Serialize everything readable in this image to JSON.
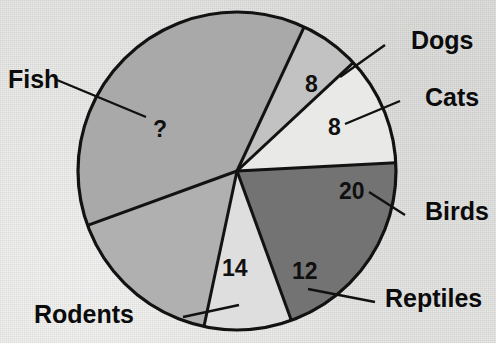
{
  "figure": {
    "kind": "pie-chart",
    "background_color": "#e7e7e5",
    "outline_color": "#121212"
  },
  "chart_data": {
    "type": "pie",
    "title": "",
    "xlabel": "",
    "ylabel": "",
    "legend_position": "none",
    "grid": false,
    "note": "One slice value is unknown and marked with a question mark",
    "unknown_marker": "?",
    "known_total": 62,
    "categories": [
      "Dogs",
      "Cats",
      "Birds",
      "Reptiles",
      "Rodents",
      "Fish"
    ],
    "values": [
      8,
      8,
      20,
      12,
      14,
      null
    ],
    "labels": [
      "8",
      "8",
      "20",
      "12",
      "14",
      "?"
    ],
    "slices": [
      {
        "name": "Dogs",
        "value": 8,
        "value_label": "8",
        "color": "#c2c2c2",
        "start_angle": 25,
        "end_angle": 47,
        "num_x": 305,
        "num_y": 92,
        "label_x": 411,
        "label_y": 49,
        "leader": "340,77 385,45"
      },
      {
        "name": "Cats",
        "value": 8,
        "value_label": "8",
        "color": "#e9e9e7",
        "start_angle": 47,
        "end_angle": 87,
        "num_x": 328,
        "num_y": 135,
        "label_x": 425,
        "label_y": 106,
        "leader": "345,124 400,101"
      },
      {
        "name": "Birds",
        "value": 20,
        "value_label": "20",
        "color": "#737373",
        "start_angle": 87,
        "end_angle": 160,
        "num_x": 339,
        "num_y": 199,
        "label_x": 425,
        "label_y": 220,
        "leader": "369,192 405,215"
      },
      {
        "name": "Reptiles",
        "value": 12,
        "value_label": "12",
        "color": "#dedede",
        "start_angle": 160,
        "end_angle": 192,
        "num_x": 292,
        "num_y": 279,
        "label_x": 385,
        "label_y": 307,
        "leader": "308,289 375,302"
      },
      {
        "name": "Rodents",
        "value": 14,
        "value_label": "14",
        "color": "#b0b0b0",
        "start_angle": 192,
        "end_angle": 250,
        "num_x": 222,
        "num_y": 276,
        "label_x": 34,
        "label_y": 323,
        "leader": "239,305 183,317"
      },
      {
        "name": "Fish",
        "value": null,
        "value_label": "?",
        "color": "#a9a9a9",
        "start_angle": 250,
        "end_angle": 385,
        "num_x": 153,
        "num_y": 137,
        "label_x": 8,
        "label_y": 88,
        "leader": "146,117 57,80"
      }
    ],
    "geometry": {
      "center_x": 237,
      "center_y": 171,
      "radius": 159
    }
  }
}
